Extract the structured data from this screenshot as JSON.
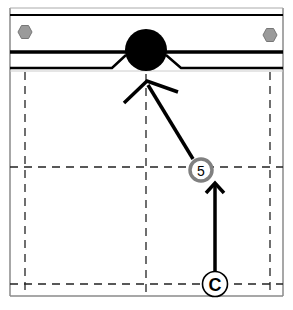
{
  "diagram": {
    "type": "pool-table-shot-diagram",
    "colors": {
      "line": "#000000",
      "dash": "#222222",
      "frame": "#8a8a8a",
      "bolt": "#9a9a9a",
      "ball": "#000000",
      "ring_5": "#808080",
      "ring_c": "#000000"
    },
    "labels": {
      "cue_ball": "C",
      "object_ball": "5"
    },
    "markers": [
      {
        "id": "cue",
        "label": "C",
        "x": 215,
        "y": 284
      },
      {
        "id": "ball5",
        "label": "5",
        "x": 201,
        "y": 170
      }
    ],
    "pocket_ball": {
      "x": 146,
      "y": 50,
      "r": 21
    },
    "bolts": [
      {
        "x": 25,
        "y": 32
      },
      {
        "x": 270,
        "y": 35
      }
    ],
    "grid": {
      "vertical_x": [
        25,
        146,
        270
      ],
      "horizontal_y": [
        167,
        284
      ]
    },
    "arrows": [
      {
        "from": "C",
        "to": "5"
      },
      {
        "from": "5",
        "to": "pocket"
      }
    ]
  }
}
